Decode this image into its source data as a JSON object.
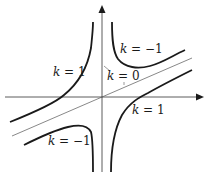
{
  "diagram": {
    "type": "level-curves",
    "labels": [
      {
        "id": "k-neg1-upper",
        "var": "k",
        "eq": " = ",
        "val": "−1"
      },
      {
        "id": "k-1-left",
        "var": "k",
        "eq": " = ",
        "val": "1"
      },
      {
        "id": "k-0",
        "var": "k",
        "eq": " = ",
        "val": "0"
      },
      {
        "id": "k-1-right",
        "var": "k",
        "eq": " = ",
        "val": "1"
      },
      {
        "id": "k-neg1-lower",
        "var": "k",
        "eq": " = ",
        "val": "−1"
      }
    ],
    "colors": {
      "curve": "#1a1a1a",
      "axis": "#333333",
      "asymptote": "#555555",
      "background": "#ffffff"
    }
  }
}
